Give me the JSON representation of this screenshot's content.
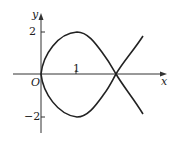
{
  "diagram": {
    "type": "function-curve-plot",
    "axes": {
      "x_label": "x",
      "y_label": "y",
      "origin_label": "O",
      "x_ticks": [
        {
          "value": 1,
          "label": "1"
        }
      ],
      "y_ticks": [
        {
          "value": 2,
          "label": "2"
        },
        {
          "value": -2,
          "label": "−2"
        }
      ]
    },
    "curve": {
      "description": "Closed loop from origin through (1,2) and (1,-2), self-intersecting on the x-axis near x=2.2, with branches continuing outward",
      "stroke_color": "#222222",
      "upper_peak": [
        1,
        2
      ],
      "lower_trough": [
        1,
        -2
      ],
      "self_intersection": [
        2.2,
        0
      ]
    },
    "colors": {
      "axis": "#333333",
      "curve": "#222222",
      "background": "#ffffff"
    }
  }
}
